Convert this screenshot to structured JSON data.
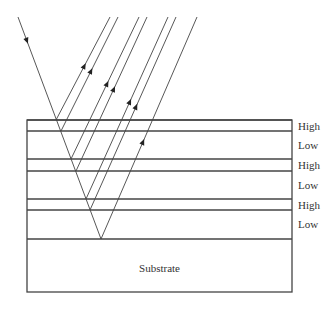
{
  "diagram": {
    "layers": [
      {
        "label": "High",
        "y_top": 120,
        "y_bottom": 131
      },
      {
        "label": "Low",
        "y_top": 131,
        "y_bottom": 159
      },
      {
        "label": "High",
        "y_top": 159,
        "y_bottom": 171
      },
      {
        "label": "Low",
        "y_top": 171,
        "y_bottom": 199
      },
      {
        "label": "High",
        "y_top": 199,
        "y_bottom": 210
      },
      {
        "label": "Low",
        "y_top": 210,
        "y_bottom": 239
      }
    ],
    "substrate": {
      "label": "Substrate",
      "y_top": 239,
      "y_bottom": 292
    },
    "incident_ray": {
      "from": [
        18,
        17
      ],
      "to": [
        101,
        239
      ]
    },
    "reflected_rays": [
      {
        "from": [
          56,
          120
        ],
        "to": [
          110,
          17
        ]
      },
      {
        "from": [
          61,
          131
        ],
        "to": [
          118,
          17
        ]
      },
      {
        "from": [
          71,
          159
        ],
        "to": [
          139,
          17
        ]
      },
      {
        "from": [
          76,
          171
        ],
        "to": [
          147,
          17
        ]
      },
      {
        "from": [
          86,
          199
        ],
        "to": [
          168,
          17
        ]
      },
      {
        "from": [
          90,
          210
        ],
        "to": [
          176,
          17
        ]
      },
      {
        "from": [
          101,
          239
        ],
        "to": [
          197,
          17
        ]
      }
    ],
    "colors": {
      "line": "#444444",
      "text": "#333333"
    }
  }
}
